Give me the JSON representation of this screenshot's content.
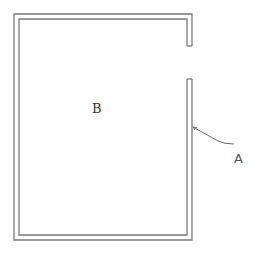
{
  "diagram": {
    "type": "floor-plan-outline",
    "labels": {
      "room": "B",
      "wall": "A"
    },
    "colors": {
      "background": "#ffffff",
      "line": "#7a7a7a"
    },
    "elements": [
      {
        "id": "room",
        "label": "B",
        "description": "Rectangular enclosed area drawn with double-line walls"
      },
      {
        "id": "wall",
        "label": "A",
        "description": "Right-side wall segment indicated by leader line"
      },
      {
        "id": "opening",
        "label": "",
        "description": "Gap/opening in the right wall near the top"
      }
    ]
  }
}
